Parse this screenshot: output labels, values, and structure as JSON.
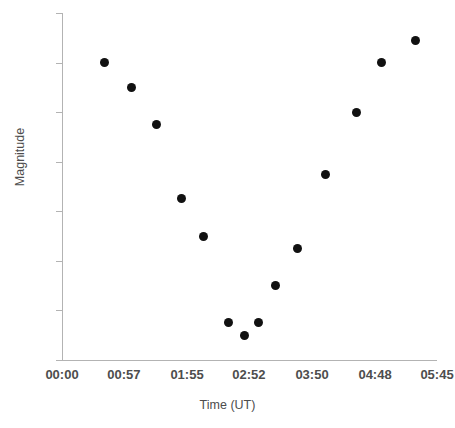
{
  "chart_data": {
    "type": "scatter",
    "title": "",
    "xlabel": "Time (UT)",
    "ylabel": "Magnitude",
    "grid": false,
    "legend": "none",
    "x_tick_labels": [
      "00:00",
      "00:57",
      "01:55",
      "02:52",
      "03:50",
      "04:48",
      "05:45"
    ],
    "x_tick_minutes": [
      0,
      57,
      115,
      172,
      230,
      288,
      345
    ],
    "xlim_minutes": [
      0,
      345
    ],
    "y_tick_labels": [
      "6.4",
      "6.6",
      "6.8",
      "7.0",
      "7.2",
      "7.4",
      "7.6",
      "7.8"
    ],
    "y_tick_values": [
      6.4,
      6.6,
      6.8,
      7.0,
      7.2,
      7.4,
      7.6,
      7.8
    ],
    "ylim": [
      7.8,
      6.4
    ],
    "y_inverted": true,
    "series_name": "Magnitude",
    "point_color": "#111111",
    "axis_color": "#b3b3b3",
    "text_color": "#4d4d4d",
    "points": [
      {
        "time": "00:39",
        "time_minutes": 39,
        "magnitude": 6.6
      },
      {
        "time": "01:04",
        "time_minutes": 64,
        "magnitude": 6.7
      },
      {
        "time": "01:27",
        "time_minutes": 87,
        "magnitude": 6.85
      },
      {
        "time": "01:50",
        "time_minutes": 110,
        "magnitude": 7.15
      },
      {
        "time": "02:10",
        "time_minutes": 130,
        "magnitude": 7.3
      },
      {
        "time": "02:33",
        "time_minutes": 153,
        "magnitude": 7.65
      },
      {
        "time": "02:48",
        "time_minutes": 168,
        "magnitude": 7.7
      },
      {
        "time": "03:01",
        "time_minutes": 181,
        "magnitude": 7.65
      },
      {
        "time": "03:16",
        "time_minutes": 196,
        "magnitude": 7.5
      },
      {
        "time": "03:37",
        "time_minutes": 217,
        "magnitude": 7.35
      },
      {
        "time": "04:02",
        "time_minutes": 242,
        "magnitude": 7.05
      },
      {
        "time": "04:31",
        "time_minutes": 271,
        "magnitude": 6.8
      },
      {
        "time": "04:54",
        "time_minutes": 294,
        "magnitude": 6.6
      },
      {
        "time": "05:25",
        "time_minutes": 325,
        "magnitude": 6.51
      }
    ]
  }
}
